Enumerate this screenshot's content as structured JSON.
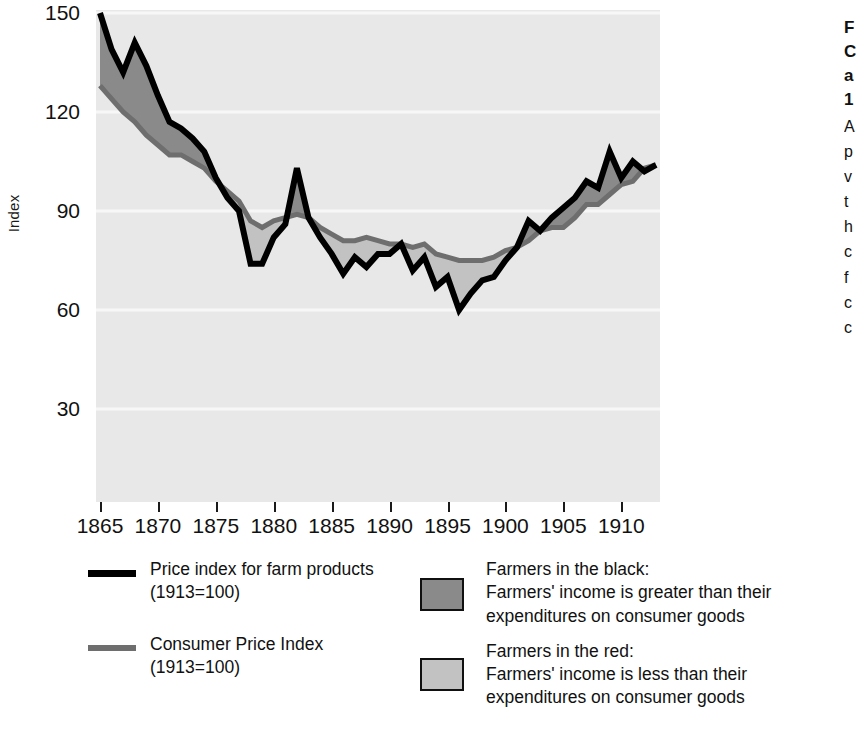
{
  "chart_data": {
    "type": "area",
    "title": "",
    "xlabel": "",
    "ylabel": "Index",
    "xlim": [
      1865,
      1913
    ],
    "ylim": [
      0,
      150
    ],
    "yticks": [
      150,
      120,
      90,
      60,
      30
    ],
    "xticks": [
      1865,
      1870,
      1875,
      1880,
      1885,
      1890,
      1895,
      1900,
      1905,
      1910
    ],
    "grid": true,
    "legend_position": "below",
    "plot_background": "#e8e8e8",
    "x": [
      1865,
      1866,
      1867,
      1868,
      1869,
      1870,
      1871,
      1872,
      1873,
      1874,
      1875,
      1876,
      1877,
      1878,
      1879,
      1880,
      1881,
      1882,
      1883,
      1884,
      1885,
      1886,
      1887,
      1888,
      1889,
      1890,
      1891,
      1892,
      1893,
      1894,
      1895,
      1896,
      1897,
      1898,
      1899,
      1900,
      1901,
      1902,
      1903,
      1904,
      1905,
      1906,
      1907,
      1908,
      1909,
      1910,
      1911,
      1912,
      1913
    ],
    "series": [
      {
        "name": "Price index for farm products (1913=100)",
        "color": "#000000",
        "values": [
          150,
          139,
          132,
          141,
          134,
          125,
          117,
          115,
          112,
          108,
          100,
          94,
          90,
          74,
          74,
          82,
          86,
          103,
          88,
          82,
          77,
          71,
          76,
          73,
          77,
          77,
          80,
          72,
          76,
          67,
          70,
          60,
          65,
          69,
          70,
          75,
          79,
          87,
          84,
          88,
          91,
          94,
          99,
          97,
          108,
          100,
          105,
          102,
          104
        ]
      },
      {
        "name": "Consumer Price Index (1913=100)",
        "color": "#6e6e6e",
        "values": [
          128,
          124,
          120,
          117,
          113,
          110,
          107,
          107,
          105,
          103,
          99,
          96,
          93,
          87,
          85,
          87,
          88,
          89,
          88,
          85,
          83,
          81,
          81,
          82,
          81,
          80,
          80,
          79,
          80,
          77,
          76,
          75,
          75,
          75,
          76,
          78,
          79,
          81,
          84,
          85,
          85,
          88,
          92,
          92,
          95,
          98,
          99,
          103,
          104
        ]
      }
    ],
    "fills": [
      {
        "name": "Farmers in the black",
        "color": "#8a8a8a",
        "meaning": "Farmers' income is greater than their expenditures on consumer goods"
      },
      {
        "name": "Farmers in the red",
        "color": "#c2c2c2",
        "meaning": "Farmers' income is less than their expenditures on consumer goods"
      }
    ]
  },
  "axis": {
    "y_label": "Index",
    "y_tick_labels": [
      "150",
      "120",
      "90",
      "60",
      "30"
    ],
    "x_tick_labels": [
      "1865",
      "1870",
      "1875",
      "1880",
      "1885",
      "1890",
      "1895",
      "1900",
      "1905",
      "1910"
    ]
  },
  "legend": {
    "left": [
      {
        "swatch": "black-line",
        "line1": "Price index for farm products",
        "line2": "(1913=100)"
      },
      {
        "swatch": "gray-line",
        "line1": "Consumer Price Index",
        "line2": "(1913=100)"
      }
    ],
    "right": [
      {
        "swatch": "dark-box",
        "line1": "Farmers in the black:",
        "line2": "Farmers' income is greater than their",
        "line3": "expenditures on consumer goods"
      },
      {
        "swatch": "light-box",
        "line1": "Farmers in the red:",
        "line2": "Farmers' income is less than their",
        "line3": "expenditures on consumer goods"
      }
    ]
  },
  "side_caption": {
    "heading_lines": [
      "F",
      "C",
      "a",
      "1"
    ],
    "body_lines": [
      "A",
      "p",
      "v",
      "t",
      "h",
      "c",
      "f",
      "c",
      "c",
      "t"
    ]
  }
}
